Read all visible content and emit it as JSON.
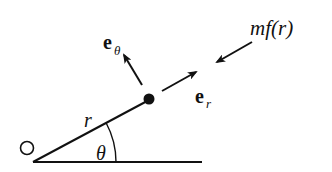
{
  "diagram": {
    "colors": {
      "ink": "#111111",
      "background": "#ffffff"
    },
    "origin": {
      "label": "O",
      "position": [
        27,
        148
      ]
    },
    "baseline": {
      "from": [
        33,
        162
      ],
      "to": [
        202,
        162
      ]
    },
    "radius_line": {
      "label": "r",
      "from": [
        33,
        162
      ],
      "to": [
        149,
        100
      ]
    },
    "particle": {
      "center": [
        149,
        99
      ],
      "radius": 5.5
    },
    "angle": {
      "label": "θ",
      "center": [
        33,
        162
      ],
      "radius": 83
    },
    "vectors": [
      {
        "name": "e_r",
        "base_label": "e",
        "sub_label": "r",
        "from": [
          162,
          91
        ],
        "to": [
          196,
          72
        ],
        "meaning": "radial unit vector"
      },
      {
        "name": "e_theta",
        "base_label": "e",
        "sub_label": "θ",
        "from": [
          142,
          85
        ],
        "to": [
          123,
          54
        ],
        "meaning": "transverse unit vector"
      },
      {
        "name": "force",
        "label": "mf(r)",
        "from": [
          252,
          42
        ],
        "to": [
          216,
          62
        ],
        "meaning": "central force toward O"
      }
    ]
  }
}
